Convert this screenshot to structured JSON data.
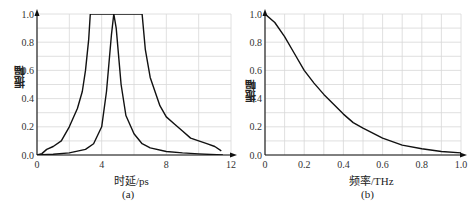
{
  "chart_data": [
    {
      "type": "line",
      "panel": "(a)",
      "title": "",
      "xlabel": "时延/ps",
      "ylabel": "振幅",
      "caption": "(a)",
      "xlim": [
        0,
        12
      ],
      "ylim": [
        0,
        1.0
      ],
      "xticks": [
        0,
        4,
        8,
        12
      ],
      "yticks": [
        0.0,
        0.2,
        0.4,
        0.6,
        0.8,
        1.0
      ],
      "ytick_labels": [
        "0.0",
        "0.2",
        "0.4",
        "0.6",
        "0.8",
        "1.0"
      ],
      "grid": true,
      "series": [
        {
          "name": "narrow pulse",
          "x": [
            0,
            1,
            2,
            3,
            3.5,
            4.0,
            4.3,
            4.6,
            4.75,
            4.9,
            5.2,
            5.5,
            6.0,
            6.5,
            7,
            8,
            9,
            10,
            11.5
          ],
          "y": [
            0.0,
            0.005,
            0.015,
            0.04,
            0.08,
            0.2,
            0.45,
            0.85,
            1.0,
            0.9,
            0.5,
            0.28,
            0.15,
            0.08,
            0.05,
            0.025,
            0.015,
            0.008,
            0.0
          ]
        },
        {
          "name": "broad pulse",
          "x": [
            0,
            0.3,
            0.6,
            1.0,
            1.5,
            2.0,
            2.5,
            2.8,
            3.0,
            3.2,
            3.3,
            6.5,
            6.7,
            7.0,
            7.3,
            7.6,
            8.0,
            8.5,
            9.0,
            9.5,
            10.0,
            10.5,
            11.0,
            11.4
          ],
          "y": [
            0.0,
            0.01,
            0.04,
            0.06,
            0.1,
            0.2,
            0.33,
            0.45,
            0.6,
            0.82,
            1.0,
            1.0,
            0.75,
            0.55,
            0.45,
            0.35,
            0.27,
            0.22,
            0.17,
            0.12,
            0.1,
            0.08,
            0.06,
            0.03
          ]
        }
      ]
    },
    {
      "type": "line",
      "panel": "(b)",
      "title": "",
      "xlabel": "频率/THz",
      "ylabel": "振幅",
      "caption": "(b)",
      "xlim": [
        0,
        1.0
      ],
      "ylim": [
        0,
        1.0
      ],
      "xticks": [
        0,
        0.2,
        0.4,
        0.6,
        0.8,
        1.0
      ],
      "xtick_labels": [
        "0",
        "0.2",
        "0.4",
        "0.6",
        "0.8",
        "1.0"
      ],
      "yticks": [
        0.0,
        0.2,
        0.4,
        0.6,
        0.8,
        1.0
      ],
      "ytick_labels": [
        "0.0",
        "0.2",
        "0.4",
        "0.6",
        "0.8",
        "1.0"
      ],
      "grid": true,
      "series": [
        {
          "name": "spectrum",
          "x": [
            0,
            0.05,
            0.1,
            0.15,
            0.2,
            0.25,
            0.3,
            0.35,
            0.4,
            0.45,
            0.5,
            0.6,
            0.7,
            0.8,
            0.9,
            1.0
          ],
          "y": [
            1.0,
            0.94,
            0.84,
            0.72,
            0.6,
            0.51,
            0.43,
            0.36,
            0.29,
            0.23,
            0.19,
            0.12,
            0.07,
            0.045,
            0.025,
            0.015
          ]
        }
      ]
    }
  ],
  "panels": {
    "a": {
      "xlabel": "时延/ps",
      "ylabel": "振幅",
      "caption": "(a)",
      "xtick_labels": [
        "0",
        "4",
        "8",
        "12"
      ]
    },
    "b": {
      "xlabel": "频率/THz",
      "ylabel": "振幅",
      "caption": "(b)",
      "xtick_labels": [
        "0",
        "0.2",
        "0.4",
        "0.6",
        "0.8",
        "1.0"
      ]
    }
  },
  "style": {
    "grid_color": "#d8d8d8",
    "axis_color": "#111111",
    "line_color": "#111111"
  }
}
